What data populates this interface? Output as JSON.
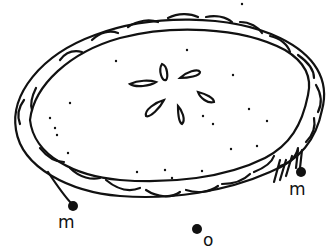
{
  "figure": {
    "colors": {
      "ink": "#111111",
      "background": "#ffffff"
    },
    "labels": [
      {
        "id": "left-marker",
        "text": "m",
        "x": 61,
        "y": 214
      },
      {
        "id": "right-marker",
        "text": "m",
        "x": 292,
        "y": 183
      },
      {
        "id": "bottom-marker",
        "text": "o",
        "x": 203,
        "y": 233
      }
    ]
  }
}
